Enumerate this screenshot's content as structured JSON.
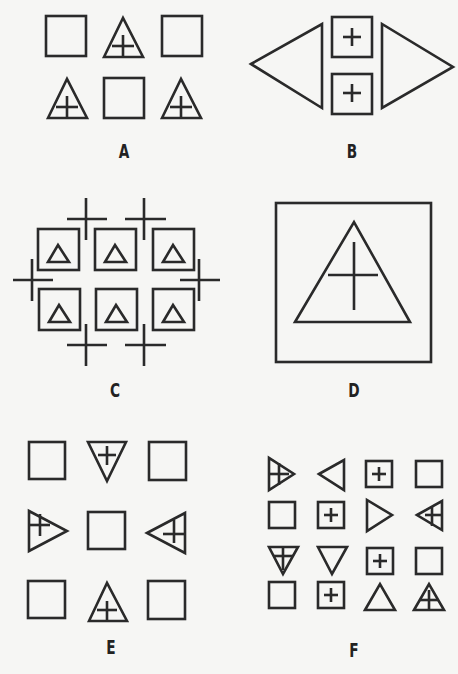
{
  "colors": {
    "background": "#f6f6f4",
    "stroke": "#2a2a2a"
  },
  "panels": [
    {
      "id": "A",
      "label": "A",
      "description": "2x3 grid alternating squares and upward triangles containing a plus sign",
      "shapes": [
        {
          "type": "square",
          "x": 45,
          "y": 15,
          "w": 40,
          "h": 40
        },
        {
          "type": "triangle-up-plus",
          "cx": 123,
          "base": 56,
          "top": 18,
          "w": 40
        },
        {
          "type": "square",
          "x": 160,
          "y": 15,
          "w": 41,
          "h": 41
        },
        {
          "type": "triangle-up-plus",
          "cx": 67,
          "base": 118,
          "top": 79,
          "w": 40
        },
        {
          "type": "square",
          "x": 103,
          "y": 78,
          "w": 40,
          "h": 40
        },
        {
          "type": "triangle-up-plus",
          "cx": 181,
          "base": 118,
          "top": 79,
          "w": 40
        }
      ]
    },
    {
      "id": "B",
      "label": "B",
      "description": "Left-pointing triangle, two stacked squares with plus signs, right-pointing triangle"
    },
    {
      "id": "C",
      "label": "C",
      "description": "2x3 grid of squares each containing a small triangle, surrounded by six plus/cross marks"
    },
    {
      "id": "D",
      "label": "D",
      "description": "One large square containing a large triangle with a plus sign inside"
    },
    {
      "id": "E",
      "label": "E",
      "description": "3x3 grid: squares at corners and center, triangles with plus signs on edges pointing inward/outward"
    },
    {
      "id": "F",
      "label": "F",
      "description": "4x4 grid of mixed squares, squares with plus, triangles in various orientations, some with plus lines"
    }
  ]
}
